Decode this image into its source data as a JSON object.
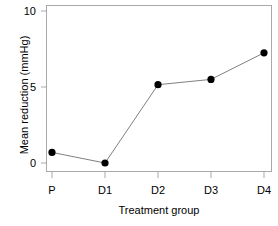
{
  "chart_data": {
    "type": "line",
    "title": "",
    "subtitle": "",
    "xlabel": "Treatment group",
    "ylabel": "Mean reduction (mmHg)",
    "categories": [
      "P",
      "D1",
      "D2",
      "D3",
      "D4"
    ],
    "values": [
      0.7,
      0.0,
      5.15,
      5.5,
      7.25
    ],
    "series": [
      {
        "name": "Mean reduction",
        "values": [
          0.7,
          0.0,
          5.15,
          5.5,
          7.25
        ]
      }
    ],
    "ylim": [
      0,
      10
    ],
    "yticks": [
      0,
      5,
      10
    ],
    "ytick_labels": [
      "0",
      "5",
      "10"
    ],
    "xtick_labels": [
      "P",
      "D1",
      "D2",
      "D3",
      "D4"
    ],
    "grid": false,
    "legend": false,
    "legend_position": "none",
    "marker": "filled-circle",
    "marker_color": "#000000",
    "line_color": "#808080",
    "axis_color": "#a9a9a9",
    "background": "#ffffff"
  },
  "axes": {
    "y_tick_0": "0",
    "y_tick_5": "5",
    "y_tick_10": "10",
    "x_tick_1": "P",
    "x_tick_2": "D1",
    "x_tick_3": "D2",
    "x_tick_4": "D3",
    "x_tick_5": "D4"
  }
}
